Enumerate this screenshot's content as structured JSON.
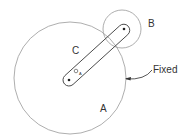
{
  "diagram": {
    "labels": {
      "a": "A",
      "b": "B",
      "c": "C",
      "fixed": "Fixed",
      "pivot": "O",
      "pivot_sub": "A"
    },
    "colors": {
      "stroke": "#888888",
      "text": "#333333",
      "background": "#ffffff"
    }
  }
}
